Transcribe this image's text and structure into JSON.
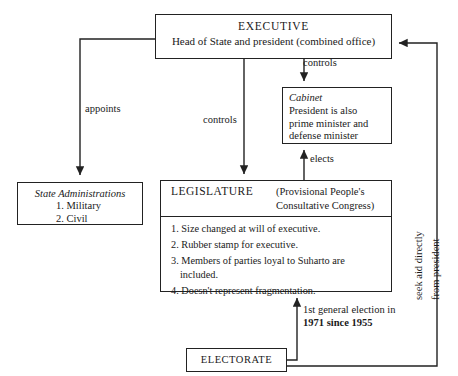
{
  "diagram": {
    "executive": {
      "name": "EXECUTIVE",
      "subtitle": "Head of State and president (combined office)"
    },
    "cabinet": {
      "name": "Cabinet",
      "lines": [
        "President is also",
        "prime minister and",
        "defense minister"
      ]
    },
    "state_administrations": {
      "name": "State Administrations",
      "items": [
        "1. Military",
        "2. Civil"
      ]
    },
    "legislature": {
      "name": "LEGISLATURE",
      "subtitle_line1": "(Provisional People's",
      "subtitle_line2": "Consultative Congress)",
      "items": [
        "1. Size changed at will of executive.",
        "2. Rubber stamp for executive.",
        "3. Members of parties loyal to Suharto are included.",
        "4. Doesn't represent fragmentation."
      ]
    },
    "electorate": {
      "name": "ELECTORATE"
    },
    "labels": {
      "appoints": "appoints",
      "controls_legislature": "controls",
      "controls_cabinet": "controls",
      "elects": "elects",
      "election_line1": "1st general election in",
      "election_line2": "1971 since 1955",
      "seek_aid_line1": "seek aid directly",
      "seek_aid_line2": "from president"
    },
    "colors": {
      "line": "#222222",
      "text": "#1a1a1a",
      "background": "#ffffff"
    }
  }
}
